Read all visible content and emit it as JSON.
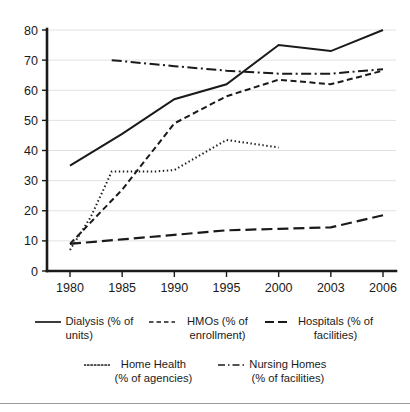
{
  "chart_data": {
    "type": "line",
    "title": "",
    "subtitle": "",
    "xlabel": "",
    "ylabel": "",
    "x": [
      1980,
      1985,
      1990,
      1995,
      2000,
      2003,
      2006
    ],
    "xtick_labels": [
      "1980",
      "1985",
      "1990",
      "1995",
      "2000",
      "2003",
      "2006"
    ],
    "ytick_labels": [
      "0",
      "10",
      "20",
      "30",
      "40",
      "50",
      "60",
      "70",
      "80"
    ],
    "yticks": [
      0,
      10,
      20,
      30,
      40,
      50,
      60,
      70,
      80
    ],
    "ylim": [
      0,
      80
    ],
    "grid": "horizontal",
    "legend_position": "bottom",
    "series": [
      {
        "name": "Dialysis (% of units)",
        "label_line1": "Dialysis (% of",
        "label_line2": "units)",
        "style": "solid",
        "color": "#1a1a1a",
        "points": [
          {
            "x": 1980,
            "y": 35
          },
          {
            "x": 1985,
            "y": 45.5
          },
          {
            "x": 1990,
            "y": 57
          },
          {
            "x": 1995,
            "y": 62
          },
          {
            "x": 2000,
            "y": 75
          },
          {
            "x": 2003,
            "y": 73
          },
          {
            "x": 2006,
            "y": 80
          }
        ]
      },
      {
        "name": "HMOs (% of enrollment)",
        "label_line1": "HMOs (% of",
        "label_line2": "enrollment)",
        "style": "dashed",
        "color": "#1a1a1a",
        "points": [
          {
            "x": 1980,
            "y": 9
          },
          {
            "x": 1985,
            "y": 27
          },
          {
            "x": 1990,
            "y": 49
          },
          {
            "x": 1995,
            "y": 58
          },
          {
            "x": 2000,
            "y": 63.5
          },
          {
            "x": 2003,
            "y": 62
          },
          {
            "x": 2006,
            "y": 66.5
          }
        ]
      },
      {
        "name": "Hospitals (% of facilities)",
        "label_line1": "Hospitals (% of",
        "label_line2": "facilities)",
        "style": "long-dash",
        "color": "#1a1a1a",
        "points": [
          {
            "x": 1980,
            "y": 9
          },
          {
            "x": 1985,
            "y": 10.5
          },
          {
            "x": 1990,
            "y": 12
          },
          {
            "x": 1995,
            "y": 13.5
          },
          {
            "x": 2000,
            "y": 14
          },
          {
            "x": 2003,
            "y": 14.5
          },
          {
            "x": 2006,
            "y": 18.5
          }
        ]
      },
      {
        "name": "Home Health (% of agencies)",
        "label_line1": "Home Health",
        "label_line2": "(% of agencies)",
        "style": "dotted",
        "color": "#1a1a1a",
        "points": [
          {
            "x": 1980,
            "y": 7
          },
          {
            "x": 1982,
            "y": 18
          },
          {
            "x": 1984,
            "y": 33
          },
          {
            "x": 1988,
            "y": 33
          },
          {
            "x": 1990,
            "y": 33.5
          },
          {
            "x": 1995,
            "y": 43.5
          },
          {
            "x": 2000,
            "y": 41
          }
        ]
      },
      {
        "name": "Nursing Homes (% of facilities)",
        "label_line1": "Nursing Homes",
        "label_line2": "(% of facilities)",
        "style": "dash-dot",
        "color": "#1a1a1a",
        "points": [
          {
            "x": 1984,
            "y": 70
          },
          {
            "x": 1990,
            "y": 68
          },
          {
            "x": 1995,
            "y": 66.5
          },
          {
            "x": 2000,
            "y": 65.5
          },
          {
            "x": 2003,
            "y": 65.5
          },
          {
            "x": 2006,
            "y": 67
          }
        ]
      }
    ]
  },
  "legend": {
    "entries": [
      {
        "swatch": "solid-line-swatch",
        "text": "Dialysis (% of\nunits)"
      },
      {
        "swatch": "dashed-line-swatch",
        "text": "HMOs (% of\nenrollment)"
      },
      {
        "swatch": "long-dash-line-swatch",
        "text": "Hospitals (% of\nfacilities)"
      },
      {
        "swatch": "dotted-line-swatch",
        "text": "Home Health\n(% of agencies)"
      },
      {
        "swatch": "dash-dot-line-swatch",
        "text": "Nursing Homes\n(% of facilities)"
      }
    ]
  }
}
